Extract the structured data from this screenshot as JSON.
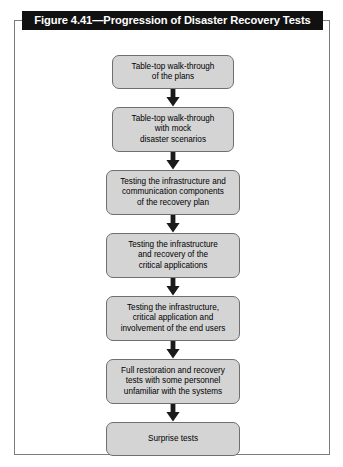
{
  "figure": {
    "title": "Figure 4.41—Progression of Disaster Recovery Tests",
    "title_background": "#111111",
    "title_color": "#ffffff",
    "frame_border_color": "#7c7c7c",
    "node_fill": "#d4d4d4",
    "node_border": "#6f6f6f",
    "connector_color": "#1a1a1a"
  },
  "flow": {
    "orientation": "top-to-bottom",
    "connector_icon": "down-arrow-icon",
    "steps": [
      {
        "index": 1,
        "lines": [
          "Table-top walk-through",
          "of the plans"
        ],
        "width": "narrow",
        "line_count": 2
      },
      {
        "index": 2,
        "lines": [
          "Table-top walk-through",
          "with mock",
          "disaster scenarios"
        ],
        "width": "narrow",
        "line_count": 3
      },
      {
        "index": 3,
        "lines": [
          "Testing the infrastructure and",
          "communication components",
          "of the recovery plan"
        ],
        "width": "wide",
        "line_count": 3
      },
      {
        "index": 4,
        "lines": [
          "Testing the infrastructure",
          "and recovery of the",
          "critical applications"
        ],
        "width": "wide",
        "line_count": 3
      },
      {
        "index": 5,
        "lines": [
          "Testing the infrastructure,",
          "critical application and",
          "involvement of the end users"
        ],
        "width": "wide",
        "line_count": 3
      },
      {
        "index": 6,
        "lines": [
          "Full restoration and recovery",
          "tests with some personnel",
          "unfamiliar with the systems"
        ],
        "width": "wide",
        "line_count": 3
      },
      {
        "index": 7,
        "lines": [
          "Surprise tests"
        ],
        "width": "wide",
        "line_count": 1
      }
    ]
  }
}
